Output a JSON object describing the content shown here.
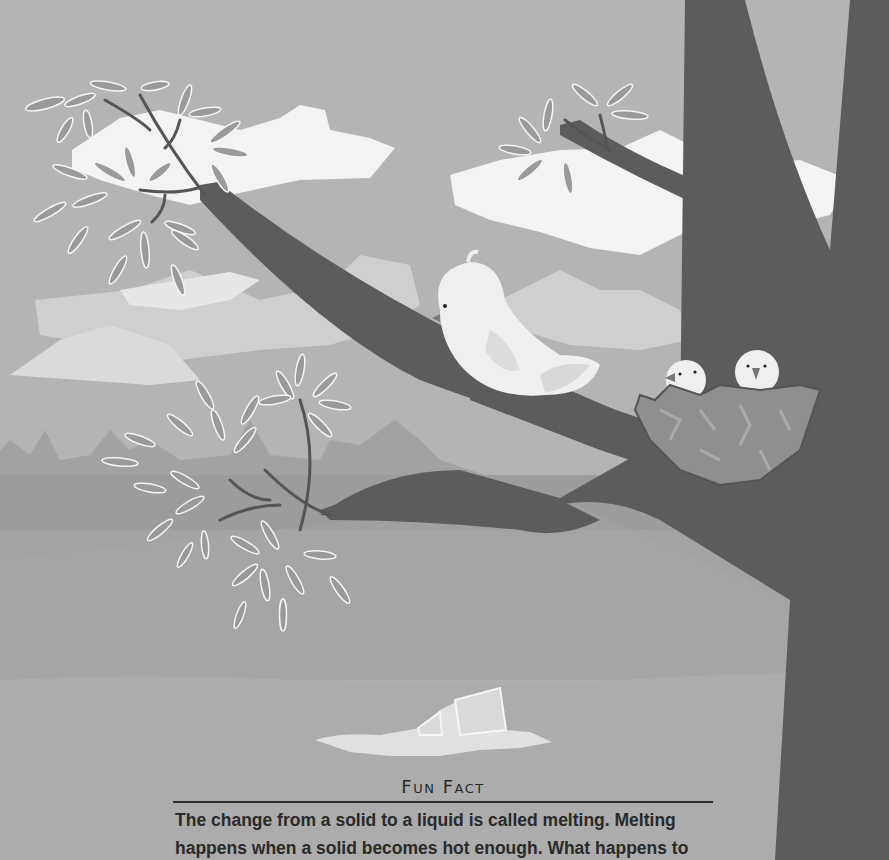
{
  "illustration": {
    "description": "Tree branch with mother bird and nest of two chicks; clouds; melting ice puddle on ground",
    "colors": {
      "sky": "#b4b4b4",
      "cloud": "#f4f4f4",
      "cloud_far": "#d6d6d6",
      "tree": "#5c5c5c",
      "ground_far": "#9e9e9e",
      "ground_mid": "#a3a3a3",
      "ground_near": "#aeaeae",
      "leaf": "#9a9a9a",
      "nest": "#8f8f8f",
      "bird": "#efefef"
    }
  },
  "fun_fact": {
    "title": "Fun Fact",
    "lines": [
      "The change from a solid to a liquid is called melting. Melting",
      "happens when a solid becomes hot enough. What happens to"
    ]
  }
}
